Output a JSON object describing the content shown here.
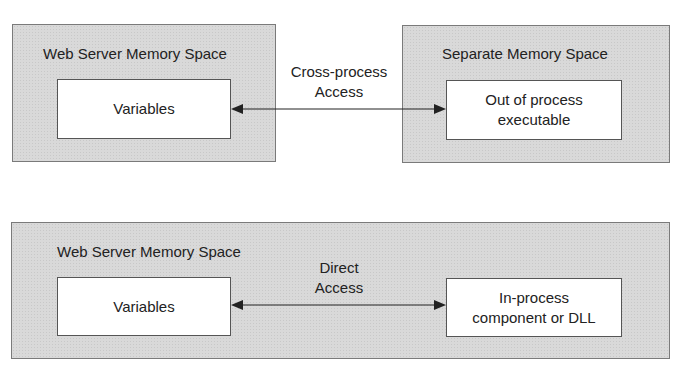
{
  "top_diagram": {
    "left_box": {
      "title": "Web Server Memory Space",
      "inner_label": "Variables"
    },
    "right_box": {
      "title": "Separate Memory Space",
      "inner_label_line1": "Out of process",
      "inner_label_line2": "executable"
    },
    "connector": {
      "label_line1": "Cross-process",
      "label_line2": "Access",
      "type": "bidirectional-arrow"
    }
  },
  "bottom_diagram": {
    "box": {
      "title": "Web Server Memory Space"
    },
    "left_inner_label": "Variables",
    "right_inner_label_line1": "In-process",
    "right_inner_label_line2": "component or DLL",
    "connector": {
      "label_line1": "Direct",
      "label_line2": "Access",
      "type": "bidirectional-arrow"
    }
  },
  "colors": {
    "box_fill": "#d9d9d9",
    "inner_fill": "#ffffff",
    "line": "#222222"
  }
}
